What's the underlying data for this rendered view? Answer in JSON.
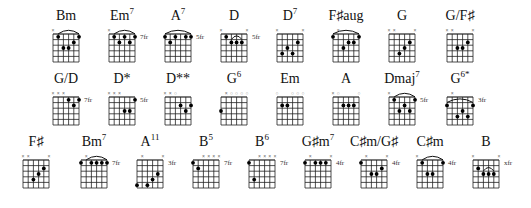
{
  "chord_sheet": {
    "rows": [
      {
        "y": 8,
        "chords": [
          {
            "x": 36,
            "name": "Bm",
            "sup": "",
            "fret": "",
            "top": [
              "x",
              "",
              "",
              "",
              "",
              ""
            ],
            "barre": [
              [
                1,
                1,
                5
              ]
            ],
            "dots": [
              [
                1,
                1
              ],
              [
                5,
                1
              ],
              [
                4,
                2
              ],
              [
                2,
                3
              ],
              [
                3,
                3
              ]
            ]
          },
          {
            "x": 92,
            "name": "Em",
            "sup": "7",
            "fret": "7fr",
            "top": [
              "x",
              "",
              "",
              "",
              "",
              ""
            ],
            "barre": [
              [
                1,
                1,
                5
              ]
            ],
            "dots": [
              [
                1,
                1
              ],
              [
                3,
                1
              ],
              [
                5,
                1
              ],
              [
                2,
                2
              ],
              [
                4,
                2
              ]
            ]
          },
          {
            "x": 148,
            "name": "A",
            "sup": "7",
            "fret": "5fr",
            "top": [
              "",
              "",
              "",
              "",
              "",
              ""
            ],
            "barre": [
              [
                1,
                0,
                5
              ]
            ],
            "dots": [
              [
                0,
                1
              ],
              [
                2,
                1
              ],
              [
                4,
                1
              ],
              [
                5,
                1
              ],
              [
                1,
                2
              ]
            ]
          },
          {
            "x": 204,
            "name": "D",
            "sup": "",
            "fret": "5fr",
            "top": [
              "x",
              "",
              "",
              "",
              "",
              "x"
            ],
            "barre": [
              [
                2,
                2,
                4
              ]
            ],
            "dots": [
              [
                1,
                1
              ],
              [
                2,
                2
              ],
              [
                3,
                2
              ],
              [
                4,
                2
              ]
            ]
          },
          {
            "x": 260,
            "name": "D",
            "sup": "7",
            "fret": "",
            "top": [
              "x",
              "",
              "",
              "",
              "",
              "x"
            ],
            "barre": [],
            "dots": [
              [
                4,
                2
              ],
              [
                2,
                3
              ],
              [
                1,
                4
              ],
              [
                3,
                4
              ]
            ]
          },
          {
            "x": 316,
            "name": "F♯aug",
            "sup": "",
            "fret": "",
            "top": [
              "",
              "x",
              "",
              "",
              "",
              ""
            ],
            "barre": [
              [
                1,
                0,
                5
              ]
            ],
            "dots": [
              [
                0,
                1
              ],
              [
                5,
                1
              ],
              [
                3,
                2
              ],
              [
                4,
                2
              ],
              [
                2,
                3
              ]
            ]
          },
          {
            "x": 372,
            "name": "G",
            "sup": "",
            "fret": "",
            "top": [
              "x",
              "x",
              "",
              "",
              "",
              "x"
            ],
            "barre": [],
            "dots": [
              [
                4,
                2
              ],
              [
                3,
                3
              ],
              [
                2,
                4
              ]
            ]
          },
          {
            "x": 430,
            "name": "G/F♯",
            "sup": "",
            "fret": "",
            "top": [
              "x",
              "x",
              "",
              "",
              "",
              "x"
            ],
            "barre": [],
            "dots": [
              [
                4,
                2
              ],
              [
                2,
                3
              ],
              [
                3,
                3
              ]
            ]
          }
        ]
      },
      {
        "y": 71,
        "chords": [
          {
            "x": 36,
            "name": "G/D",
            "sup": "",
            "fret": "7fr",
            "top": [
              "x",
              "x",
              "x",
              "",
              "",
              ""
            ],
            "barre": [],
            "dots": [
              [
                3,
                1
              ],
              [
                5,
                1
              ],
              [
                4,
                2
              ]
            ]
          },
          {
            "x": 92,
            "name": "D*",
            "sup": "",
            "fret": "5fr",
            "top": [
              "x",
              "x",
              "x",
              "",
              "",
              ""
            ],
            "barre": [],
            "dots": [
              [
                5,
                1
              ],
              [
                3,
                3
              ],
              [
                4,
                3
              ]
            ]
          },
          {
            "x": 148,
            "name": "D**",
            "sup": "",
            "fret": "",
            "top": [
              "x",
              "x",
              "o",
              "",
              "",
              ""
            ],
            "barre": [],
            "dots": [
              [
                3,
                2
              ],
              [
                5,
                2
              ],
              [
                4,
                3
              ]
            ]
          },
          {
            "x": 204,
            "name": "G",
            "sup": "6",
            "fret": "",
            "top": [
              "",
              "x",
              "o",
              "o",
              "o",
              "o"
            ],
            "barre": [],
            "dots": [
              [
                0,
                3
              ]
            ]
          },
          {
            "x": 260,
            "name": "Em",
            "sup": "",
            "fret": "",
            "top": [
              "o",
              "",
              "",
              "o",
              "o",
              "o"
            ],
            "barre": [],
            "dots": [
              [
                1,
                2
              ],
              [
                2,
                2
              ]
            ]
          },
          {
            "x": 316,
            "name": "A",
            "sup": "",
            "fret": "",
            "top": [
              "x",
              "o",
              "",
              "",
              "",
              "o"
            ],
            "barre": [],
            "dots": [
              [
                2,
                2
              ],
              [
                3,
                2
              ],
              [
                4,
                2
              ]
            ]
          },
          {
            "x": 372,
            "name": "Dmaj",
            "sup": "7",
            "fret": "5fr",
            "top": [
              "x",
              "",
              "",
              "",
              "",
              ""
            ],
            "barre": [
              [
                1,
                1,
                5
              ]
            ],
            "dots": [
              [
                1,
                1
              ],
              [
                5,
                1
              ],
              [
                3,
                2
              ],
              [
                2,
                3
              ],
              [
                4,
                3
              ]
            ]
          },
          {
            "x": 430,
            "name": "G",
            "sup": "6*",
            "fret": "3fr",
            "top": [
              "",
              "x",
              "",
              "",
              "",
              ""
            ],
            "barre": [
              [
                2,
                0,
                5
              ]
            ],
            "dots": [
              [
                0,
                2
              ],
              [
                5,
                2
              ],
              [
                3,
                3
              ],
              [
                2,
                4
              ],
              [
                4,
                4
              ]
            ]
          }
        ]
      },
      {
        "y": 134,
        "chords": [
          {
            "x": 6,
            "name": "F♯",
            "sup": "",
            "fret": "",
            "top": [
              "x",
              "x",
              "",
              "",
              "",
              "x"
            ],
            "barre": [],
            "dots": [
              [
                4,
                2
              ],
              [
                3,
                3
              ],
              [
                2,
                4
              ]
            ]
          },
          {
            "x": 64,
            "name": "Bm",
            "sup": "7",
            "fret": "7fr",
            "top": [
              "",
              "x",
              "",
              "",
              "",
              ""
            ],
            "barre": [
              [
                1,
                1,
                5
              ]
            ],
            "dots": [
              [
                0,
                1
              ],
              [
                2,
                1
              ],
              [
                3,
                1
              ],
              [
                4,
                1
              ],
              [
                5,
                1
              ]
            ]
          },
          {
            "x": 120,
            "name": "A",
            "sup": "11",
            "fret": "3fr",
            "top": [
              "",
              "x",
              "",
              "",
              "",
              "x"
            ],
            "barre": [],
            "dots": [
              [
                4,
                3
              ],
              [
                3,
                4
              ],
              [
                0,
                5
              ],
              [
                2,
                5
              ]
            ]
          },
          {
            "x": 176,
            "name": "B",
            "sup": "5",
            "fret": "7fr",
            "top": [
              "",
              "",
              "x",
              "x",
              "x",
              "x"
            ],
            "barre": [],
            "dots": [
              [
                0,
                1
              ],
              [
                1,
                2
              ]
            ]
          },
          {
            "x": 232,
            "name": "B",
            "sup": "6",
            "fret": "7fr",
            "top": [
              "",
              "",
              "x",
              "x",
              "x",
              "x"
            ],
            "barre": [],
            "dots": [
              [
                0,
                1
              ],
              [
                1,
                4
              ]
            ]
          },
          {
            "x": 288,
            "name": "G♯m",
            "sup": "7",
            "fret": "4fr",
            "top": [
              "",
              "x",
              "",
              "",
              "",
              "x"
            ],
            "barre": [],
            "dots": [
              [
                0,
                1
              ],
              [
                2,
                1
              ],
              [
                3,
                1
              ],
              [
                4,
                1
              ]
            ]
          },
          {
            "x": 344,
            "name": "C♯m/G♯",
            "sup": "",
            "fret": "4fr",
            "top": [
              "",
              "x",
              "",
              "",
              "",
              "x"
            ],
            "barre": [],
            "dots": [
              [
                0,
                1
              ],
              [
                4,
                2
              ],
              [
                2,
                3
              ],
              [
                3,
                3
              ]
            ]
          },
          {
            "x": 400,
            "name": "C♯m",
            "sup": "",
            "fret": "4fr",
            "top": [
              "x",
              "",
              "",
              "",
              "",
              ""
            ],
            "barre": [
              [
                1,
                1,
                5
              ]
            ],
            "dots": [
              [
                1,
                1
              ],
              [
                5,
                1
              ],
              [
                2,
                3
              ],
              [
                3,
                3
              ]
            ]
          },
          {
            "x": 456,
            "name": "B",
            "sup": "",
            "fret": "xfr",
            "top": [
              "x",
              "",
              "",
              "",
              "",
              "x"
            ],
            "barre": [
              [
                3,
                2,
                4
              ]
            ],
            "dots": [
              [
                1,
                2
              ],
              [
                2,
                3
              ],
              [
                3,
                3
              ],
              [
                4,
                3
              ]
            ]
          }
        ]
      }
    ]
  }
}
